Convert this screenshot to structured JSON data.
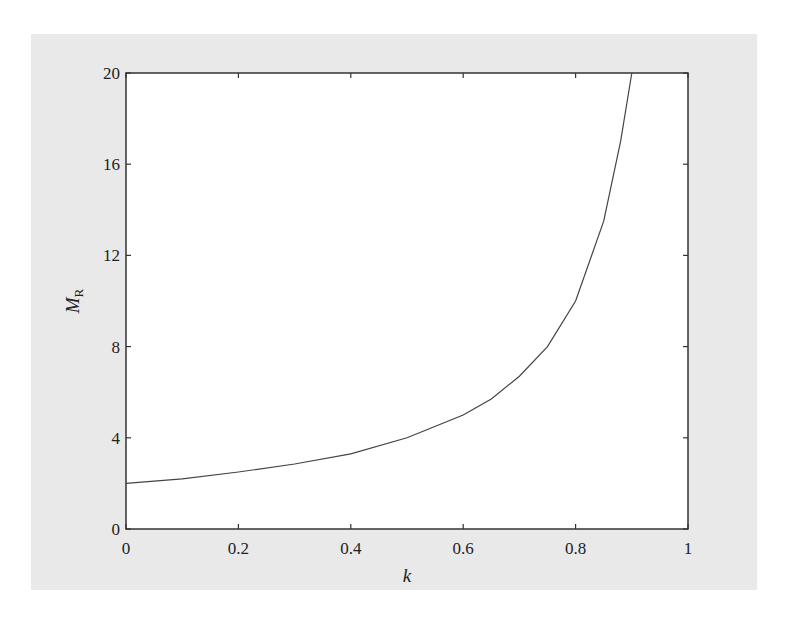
{
  "chart_data": {
    "type": "line",
    "title": "",
    "xlabel": "k",
    "ylabel": "M",
    "ylabel_subscript": "R",
    "xlim": [
      0,
      1
    ],
    "ylim": [
      0,
      20
    ],
    "xticks": [
      0,
      0.2,
      0.4,
      0.6,
      0.8,
      1
    ],
    "xtick_labels": [
      "0",
      "0.2",
      "0.4",
      "0.6",
      "0.8",
      "1"
    ],
    "yticks": [
      0,
      4,
      8,
      12,
      16,
      20
    ],
    "ytick_labels": [
      "0",
      "4",
      "8",
      "12",
      "16",
      "20"
    ],
    "grid": false,
    "legend": null,
    "series": [
      {
        "name": "M_R",
        "x": [
          0,
          0.1,
          0.2,
          0.3,
          0.4,
          0.5,
          0.6,
          0.65,
          0.7,
          0.75,
          0.8,
          0.85,
          0.88,
          0.9
        ],
        "values": [
          2.0,
          2.2,
          2.5,
          2.85,
          3.3,
          4.0,
          5.0,
          5.7,
          6.7,
          8.0,
          10.0,
          13.5,
          17.0,
          20.0
        ]
      }
    ]
  }
}
